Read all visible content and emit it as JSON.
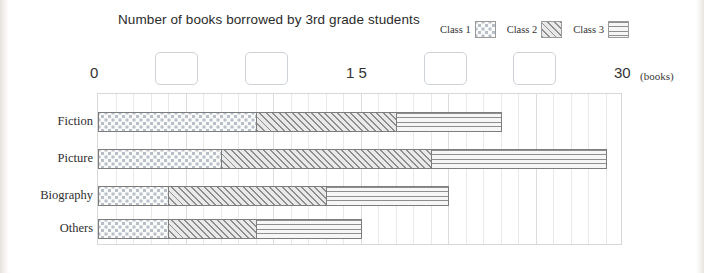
{
  "chart_data": {
    "type": "bar",
    "orientation": "horizontal",
    "stacked": true,
    "title": "Number of books borrowed by 3rd grade students",
    "xlabel": "(books)",
    "ylabel": "",
    "categories": [
      "Fiction",
      "Picture",
      "Biography",
      "Others"
    ],
    "series": [
      {
        "name": "Class 1",
        "pattern": "dots",
        "values": [
          9,
          7,
          4,
          4
        ]
      },
      {
        "name": "Class 2",
        "pattern": "diagonal-hatch",
        "values": [
          8,
          12,
          9,
          5
        ]
      },
      {
        "name": "Class 3",
        "pattern": "horizontal-lines",
        "values": [
          6,
          10,
          7,
          6
        ]
      }
    ],
    "totals": [
      23,
      29,
      20,
      15
    ],
    "xlim": [
      0,
      30
    ],
    "x_tick_interval": 1,
    "x_tick_labels_shown": [
      "0",
      "1 5",
      "30"
    ],
    "x_tick_label_values": [
      0,
      15,
      30
    ],
    "grid": true,
    "legend_position": "top-right"
  },
  "axis": {
    "label_start": "0",
    "label_middle": "1 5",
    "label_end": "30",
    "unit": "(books)"
  },
  "legend": {
    "entries": [
      {
        "label": "Class 1"
      },
      {
        "label": "Class 2"
      },
      {
        "label": "Class 3"
      }
    ]
  },
  "answer_blanks": [
    {
      "value": ""
    },
    {
      "value": ""
    },
    {
      "value": ""
    },
    {
      "value": ""
    }
  ]
}
